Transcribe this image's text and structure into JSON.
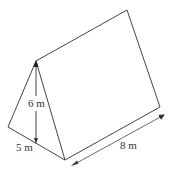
{
  "diagram": {
    "type": "triangular-prism",
    "labels": {
      "height": "6 m",
      "base": "5 m",
      "length": "8 m"
    },
    "colors": {
      "stroke": "#444444",
      "text": "#333333",
      "background": "#ffffff"
    }
  }
}
